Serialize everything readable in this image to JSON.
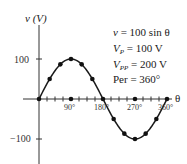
{
  "chart_data": {
    "type": "line",
    "title": "",
    "xlabel": "θ",
    "ylabel": "v (V)",
    "x": [
      0,
      30,
      60,
      90,
      120,
      150,
      180,
      210,
      240,
      270,
      300,
      330,
      360
    ],
    "series": [
      {
        "name": "v = 100 sin θ",
        "values": [
          0,
          50,
          86.6,
          100,
          86.6,
          50,
          0,
          -50,
          -86.6,
          -100,
          -86.6,
          -50,
          0
        ]
      }
    ],
    "x_ticks": [
      "90°",
      "180°",
      "270°",
      "360°"
    ],
    "y_ticks": [
      "100",
      "−100"
    ],
    "xlim": [
      0,
      360
    ],
    "ylim": [
      -150,
      150
    ],
    "grid": false,
    "annotations": [
      "v = 100 sin θ",
      "V_P = 100 V",
      "V_PP = 200 V",
      "Per = 360°"
    ]
  },
  "axes": {
    "y_label": "v (V)",
    "x_label": "θ",
    "y_tick_100": "100",
    "y_tick_neg100": "−100",
    "x_tick_90": "90°",
    "x_tick_180": "180°",
    "x_tick_270": "270°",
    "x_tick_360": "360°"
  },
  "annotations": {
    "equation_lhs": "v",
    "equation_rhs": " = 100 sin θ",
    "vp_sym": "V",
    "vp_sub": "P",
    "vp_val": " = 100 V",
    "vpp_sym": "V",
    "vpp_sub": "PP",
    "vpp_val": " = 200 V",
    "period": "Per = 360°"
  }
}
